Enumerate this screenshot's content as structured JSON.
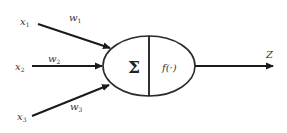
{
  "diagram": {
    "type": "perceptron-neuron",
    "inputs": [
      {
        "name": "x",
        "index": "1",
        "weight_name": "w",
        "weight_index": "1"
      },
      {
        "name": "x",
        "index": "2",
        "weight_name": "w",
        "weight_index": "2"
      },
      {
        "name": "x",
        "index": "3",
        "weight_name": "w",
        "weight_index": "3"
      }
    ],
    "node": {
      "sum_symbol": "Σ",
      "activation_label": "f(·)"
    },
    "output": {
      "label": "Z"
    },
    "colors": {
      "stroke": "#1a1a1a",
      "text": "#333333",
      "background": "#ffffff"
    }
  }
}
